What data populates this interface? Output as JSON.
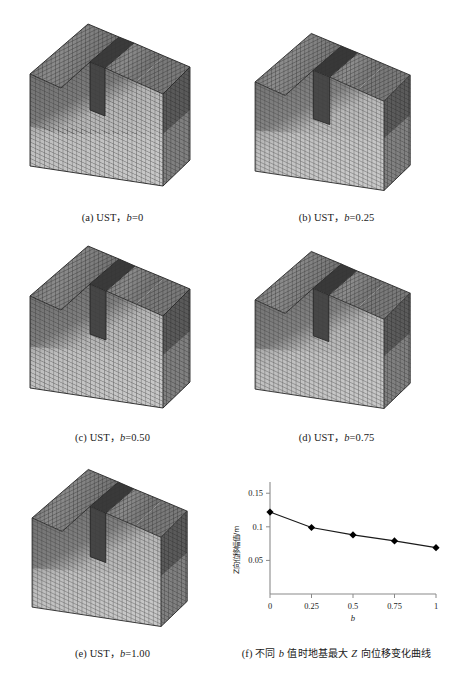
{
  "figure": {
    "background": "#ffffff",
    "ink": "#1a1a1a"
  },
  "panels": [
    {
      "id": "a",
      "caption_prefix": "(a)",
      "caption_label": "UST，",
      "caption_var": "b",
      "caption_value": "=0"
    },
    {
      "id": "b",
      "caption_prefix": "(b)",
      "caption_label": "UST，",
      "caption_var": "b",
      "caption_value": "=0.25"
    },
    {
      "id": "c",
      "caption_prefix": "(c)",
      "caption_label": "UST，",
      "caption_var": "b",
      "caption_value": "=0.50"
    },
    {
      "id": "d",
      "caption_prefix": "(d)",
      "caption_label": "UST，",
      "caption_var": "b",
      "caption_value": "=0.75"
    },
    {
      "id": "e",
      "caption_prefix": "(e)",
      "caption_label": "UST，",
      "caption_var": "b",
      "caption_value": "=1.00"
    },
    {
      "id": "f",
      "caption_prefix": "(f)",
      "caption_cn_1": "不同 ",
      "caption_var": "b",
      "caption_cn_2": " 值时地基最大 ",
      "caption_var2": "Z",
      "caption_cn_3": " 向位移变化曲线"
    }
  ],
  "model": {
    "type": "finite-element-mesh-block",
    "description": "UST soil foundation FEM mesh with central trench notch",
    "colors": {
      "top_face": "#6d6d6d",
      "top_face_light": "#a9a9a9",
      "front_face_dark": "#6f6f6f",
      "front_face_light": "#c3c3c3",
      "side_face": "#575757",
      "notch_dark": "#3a3a3a",
      "grid_line": "#3c3c3c"
    }
  },
  "chart_data": {
    "type": "line",
    "title": "",
    "xlabel": "b",
    "ylabel": "Z向位移幅值/m",
    "x": [
      0,
      0.25,
      0.5,
      0.75,
      1
    ],
    "values": [
      0.122,
      0.099,
      0.088,
      0.079,
      0.069
    ],
    "xticks": [
      "0",
      "0.25",
      "0.5",
      "0.75",
      "1"
    ],
    "xtick_values": [
      0,
      0.25,
      0.5,
      0.75,
      1
    ],
    "yticks": [
      "0.05",
      "0.1",
      "0.15"
    ],
    "ytick_values": [
      0.05,
      0.1,
      0.15
    ],
    "xlim": [
      0,
      1
    ],
    "ylim": [
      0,
      0.1667
    ],
    "grid": false,
    "legend": false,
    "marker": "diamond",
    "marker_color": "#000000",
    "line_color": "#1a1a1a"
  }
}
